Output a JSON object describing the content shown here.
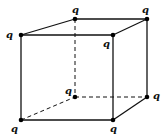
{
  "diagram": {
    "charge_label": "q",
    "colors": {
      "line": "#111111",
      "dot": "#000000",
      "background": "#ffffff"
    },
    "vertices": [
      {
        "id": "front-top-left",
        "x": 21,
        "y": 35,
        "label": "q",
        "lx": 6,
        "ly": 30
      },
      {
        "id": "front-top-right",
        "x": 113,
        "y": 35,
        "label": "q",
        "lx": 103,
        "ly": 39
      },
      {
        "id": "back-top-left",
        "x": 75,
        "y": 19,
        "label": "q",
        "lx": 72,
        "ly": 5
      },
      {
        "id": "back-top-right",
        "x": 147,
        "y": 19,
        "label": "q",
        "lx": 142,
        "ly": 5
      },
      {
        "id": "front-bottom-left",
        "x": 21,
        "y": 120,
        "label": "q",
        "lx": 11,
        "ly": 124
      },
      {
        "id": "front-bottom-right",
        "x": 113,
        "y": 120,
        "label": "q",
        "lx": 110,
        "ly": 124
      },
      {
        "id": "back-bottom-left",
        "x": 75,
        "y": 97,
        "label": "q",
        "lx": 65,
        "ly": 86
      },
      {
        "id": "back-bottom-right",
        "x": 147,
        "y": 97,
        "label": "q",
        "lx": 153,
        "ly": 91
      }
    ]
  }
}
